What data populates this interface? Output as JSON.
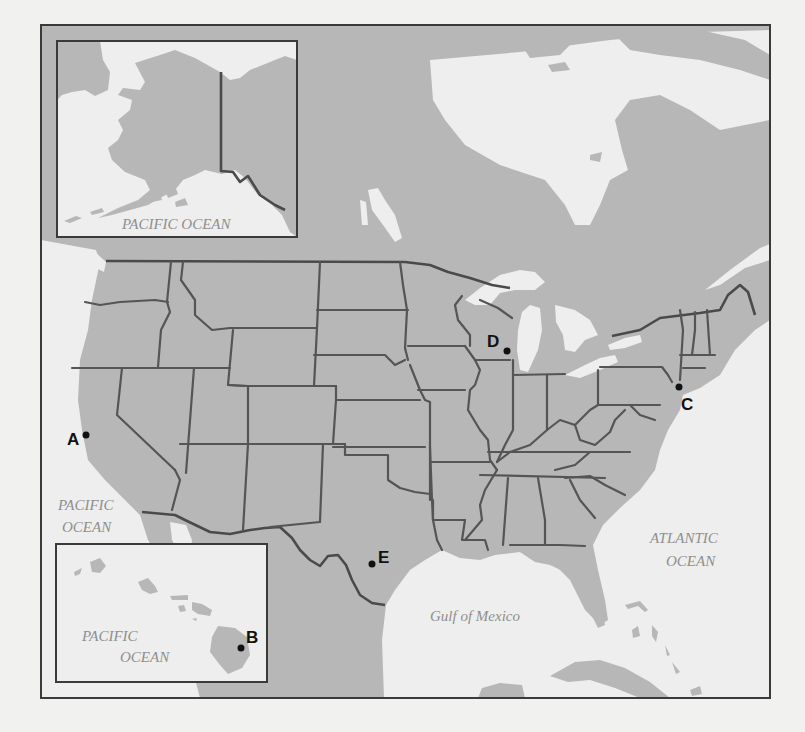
{
  "map": {
    "title": "Map of the United States with labeled locations",
    "colors": {
      "land": "#b7b7b7",
      "water": "#eeeeee",
      "background": "#f1f1f0",
      "border": "#4a4a4a",
      "label_text": "#8e8e8e",
      "marker": "#111111"
    },
    "insets": {
      "alaska": {
        "ocean_label": "PACIFIC OCEAN"
      },
      "hawaii": {
        "ocean_label_line1": "PACIFIC",
        "ocean_label_line2": "OCEAN"
      }
    },
    "water_labels": {
      "pacific_line1": "PACIFIC",
      "pacific_line2": "OCEAN",
      "atlantic_line1": "ATLANTIC",
      "atlantic_line2": "OCEAN",
      "gulf": "Gulf of Mexico"
    },
    "markers": [
      {
        "label": "A",
        "x": 86,
        "y": 435
      },
      {
        "label": "B",
        "x": 241,
        "y": 648
      },
      {
        "label": "C",
        "x": 679,
        "y": 387
      },
      {
        "label": "D",
        "x": 507,
        "y": 350
      },
      {
        "label": "E",
        "x": 372,
        "y": 563
      }
    ]
  }
}
